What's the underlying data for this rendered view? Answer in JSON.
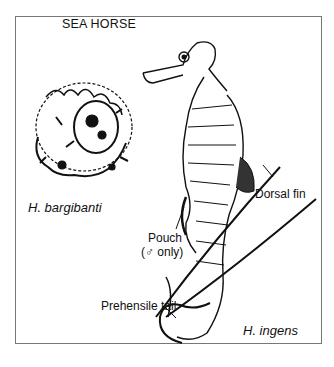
{
  "figure": {
    "title": "SEA HORSE",
    "labels": {
      "species_small": "H. bargibanti",
      "species_large": "H. ingens",
      "dorsal_fin": "Dorsal fin",
      "pouch_line1": "Pouch",
      "pouch_line2": "(♂ only)",
      "tail": "Prehensile tail"
    },
    "colors": {
      "ink": "#111111",
      "frame": "#777777",
      "background": "#ffffff"
    }
  }
}
